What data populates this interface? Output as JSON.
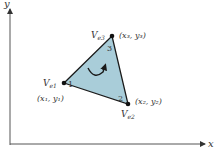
{
  "axes": {
    "x_label": "x",
    "y_label": "y"
  },
  "element": {
    "fill_color": "#a9cdd9",
    "edge_color": "#1a1a1a",
    "orientation": "counterclockwise",
    "nodes": [
      {
        "id": "1",
        "local_number": "1",
        "name_main": "V",
        "name_sub": "e1",
        "coord_label": "(x₁, y₁)"
      },
      {
        "id": "2",
        "local_number": "2",
        "name_main": "V",
        "name_sub": "e2",
        "coord_label": "(x₂, y₂)"
      },
      {
        "id": "3",
        "local_number": "3",
        "name_main": "V",
        "name_sub": "e3",
        "coord_label": "(x₃, y₃)"
      }
    ]
  }
}
